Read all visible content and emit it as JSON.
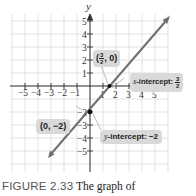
{
  "chart_data": {
    "type": "line",
    "title": "",
    "xlabel": "x",
    "ylabel": "y",
    "xlim": [
      -5,
      5
    ],
    "ylim": [
      -5,
      5
    ],
    "grid": true,
    "x_ticks": [
      "-5",
      "-4",
      "-3",
      "-2",
      "-1",
      "1",
      "2",
      "3",
      "4",
      "5"
    ],
    "y_ticks": [
      "5",
      "4",
      "3",
      "2",
      "1",
      "-2",
      "-3",
      "-4",
      "-5"
    ],
    "series": [
      {
        "name": "line",
        "equation": "y = (4/3)x - 2",
        "color": "#666666",
        "points": [
          [
            -2.9,
            -5.0
          ],
          [
            1.5,
            0
          ],
          [
            0,
            -2
          ],
          [
            6.1,
            5.3
          ]
        ]
      }
    ],
    "points": [
      {
        "label": "(0, -2)",
        "x": 0,
        "y": -2
      },
      {
        "label": "(3/2, 0)",
        "x": 1.5,
        "y": 0
      }
    ],
    "annotations": [
      {
        "text": "x-intercept: 3/2"
      },
      {
        "text": "y-intercept: -2"
      }
    ]
  },
  "labels": {
    "axis_x": "x",
    "axis_y": "y",
    "point_x_intercept": {
      "num": "3",
      "den": "2",
      "suffix": ", 0"
    },
    "point_y_intercept": "(0, −2)",
    "x_intercept_label": {
      "prefix": "x",
      "text": "-intercept: ",
      "num": "3",
      "den": "2"
    },
    "y_intercept_label": {
      "prefix": "y",
      "text": "-intercept: −2"
    }
  },
  "caption": {
    "figure": "FIGURE 2.33",
    "text": "The graph of"
  }
}
